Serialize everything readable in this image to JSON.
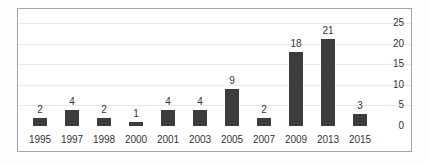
{
  "chart_data": {
    "type": "bar",
    "categories": [
      "1995",
      "1997",
      "1998",
      "2000",
      "2001",
      "2003",
      "2005",
      "2007",
      "2009",
      "2013",
      "2015"
    ],
    "values": [
      2,
      4,
      2,
      1,
      4,
      4,
      9,
      2,
      18,
      21,
      3
    ],
    "title": "",
    "xlabel": "",
    "ylabel": "",
    "ylim": [
      0,
      25
    ],
    "yticks": [
      0,
      5,
      10,
      15,
      20,
      25
    ],
    "y_axis_side": "right",
    "grid": true,
    "show_value_labels": true,
    "legend": null,
    "colors": {
      "bar": "#3d3d3d",
      "text": "#333333",
      "gridline": "#e9e9e9",
      "frame_border": "#a6a6a6",
      "plot_background": "#ffffff"
    }
  }
}
